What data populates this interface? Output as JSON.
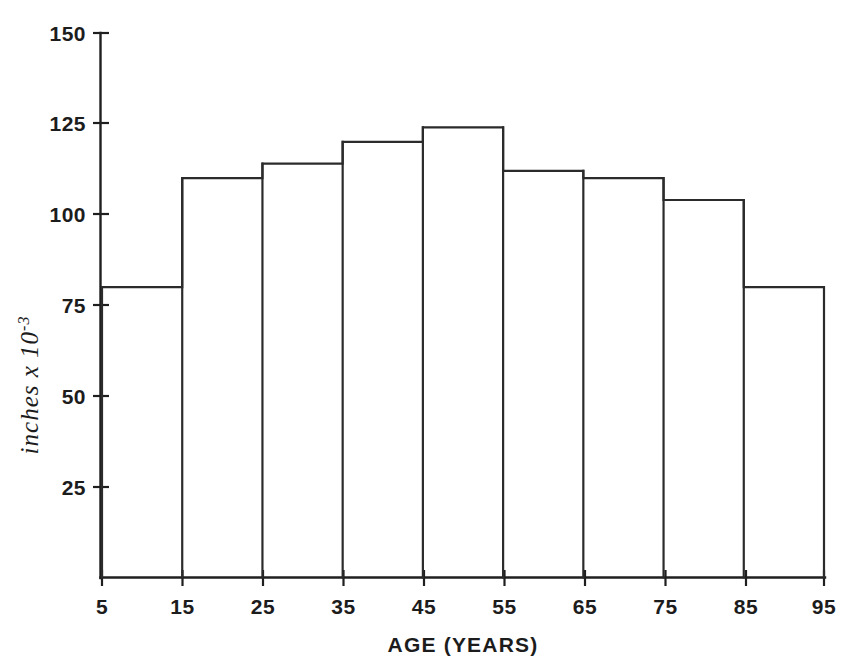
{
  "chart_data": {
    "type": "bar",
    "title": "",
    "subtitle": "",
    "xlabel": "AGE (YEARS)",
    "ylabel": "inches x 10",
    "ylabel_exponent": "-3",
    "ylabel_full": "inches x 10-3",
    "categories": [
      "5-15",
      "15-25",
      "25-35",
      "35-45",
      "45-55",
      "55-65",
      "65-75",
      "75-85",
      "85-95"
    ],
    "bin_edges": [
      5,
      15,
      25,
      35,
      45,
      55,
      65,
      75,
      85,
      95
    ],
    "values": [
      80,
      110,
      114,
      120,
      124,
      112,
      110,
      104,
      80
    ],
    "xlim": [
      5,
      95
    ],
    "ylim": [
      0,
      150
    ],
    "xticks": [
      5,
      15,
      25,
      35,
      45,
      55,
      65,
      75,
      85,
      95
    ],
    "xtick_labels": [
      "5",
      "15",
      "25",
      "35",
      "45",
      "55",
      "65",
      "75",
      "85",
      "95"
    ],
    "yticks": [
      25,
      50,
      75,
      100,
      125,
      150
    ],
    "ytick_labels": [
      "25",
      "50",
      "75",
      "100",
      "125",
      "150"
    ],
    "grid": false,
    "legend": false,
    "legend_position": "none",
    "series_style": "step-outline-histogram",
    "colors": {
      "background": "#ffffff",
      "axis": "#1f1f1f",
      "bar_outline": "#2b2b2b",
      "bar_fill": "none",
      "text": "#1c1c1c"
    }
  }
}
